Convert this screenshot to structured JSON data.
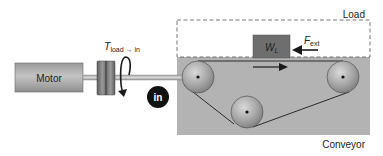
{
  "diagram": {
    "title": "",
    "labels": {
      "motor": "Motor",
      "torque_symbol": "T",
      "torque_subscript": "load → in",
      "input_marker": "in",
      "load_region": "Load",
      "weight_symbol": "W",
      "weight_subscript": "L",
      "force_symbol": "F",
      "force_subscript": "ext",
      "conveyor_region": "Conveyor"
    },
    "components": [
      {
        "id": "motor",
        "type": "box",
        "label": "Motor"
      },
      {
        "id": "shaft",
        "type": "shaft"
      },
      {
        "id": "coupling",
        "type": "coupling"
      },
      {
        "id": "torque-arrow",
        "type": "curved-arrow",
        "label": "T load→in"
      },
      {
        "id": "input-marker",
        "type": "circle-badge",
        "label": "in"
      },
      {
        "id": "load-boundary",
        "type": "dashed-box",
        "label": "Load"
      },
      {
        "id": "conveyor-boundary",
        "type": "filled-box",
        "label": "Conveyor"
      },
      {
        "id": "pulley-left",
        "type": "pulley"
      },
      {
        "id": "pulley-right",
        "type": "pulley"
      },
      {
        "id": "pulley-bottom",
        "type": "pulley"
      },
      {
        "id": "belt",
        "type": "belt"
      },
      {
        "id": "load-block",
        "type": "block",
        "label": "W_L"
      },
      {
        "id": "external-force",
        "type": "arrow",
        "direction": "left",
        "label": "F_ext"
      },
      {
        "id": "belt-motion",
        "type": "arrow",
        "direction": "right"
      }
    ],
    "colors": {
      "conveyor_fill": "#b3b3b3",
      "motor_fill": "#a9a9a9",
      "coupling_fill": "#7a7a7a",
      "load_block_fill": "#6e6e6e",
      "badge_fill": "#111111",
      "line": "#2a2a2a"
    }
  }
}
